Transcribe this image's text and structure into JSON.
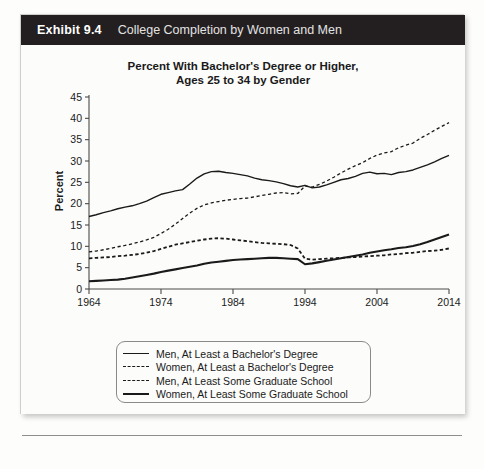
{
  "exhibit": {
    "number": "Exhibit 9.4",
    "caption": "College Completion by Women and Men"
  },
  "chart_data": {
    "type": "line",
    "title": "Percent With Bachelor's Degree or Higher, Ages 25 to 34 by Gender",
    "title_line1": "Percent With Bachelor's Degree or Higher,",
    "title_line2": "Ages 25 to 34 by Gender",
    "xlabel": "",
    "ylabel": "Percent",
    "xlim": [
      1964,
      2014
    ],
    "ylim": [
      0,
      45
    ],
    "ytick_step": 5,
    "xtick_step": 10,
    "grid": false,
    "legend_position": "below-plot",
    "yticks": [
      "0",
      "5",
      "10",
      "15",
      "20",
      "25",
      "30",
      "35",
      "40",
      "45"
    ],
    "xticks": [
      "1964",
      "1974",
      "1984",
      "1994",
      "2004",
      "2014"
    ],
    "x": [
      1964,
      1965,
      1966,
      1967,
      1968,
      1969,
      1970,
      1971,
      1972,
      1973,
      1974,
      1975,
      1976,
      1977,
      1978,
      1979,
      1980,
      1981,
      1982,
      1983,
      1984,
      1985,
      1986,
      1987,
      1988,
      1989,
      1990,
      1991,
      1992,
      1993,
      1994,
      1995,
      1996,
      1997,
      1998,
      1999,
      2000,
      2001,
      2002,
      2003,
      2004,
      2005,
      2006,
      2007,
      2008,
      2009,
      2010,
      2011,
      2012,
      2013,
      2014
    ],
    "series": [
      {
        "name": "Men, At Least a Bachelor's Degree",
        "style": "solid",
        "width": 1.4,
        "color": "#1a1a1a",
        "values": [
          17.0,
          17.4,
          17.9,
          18.3,
          18.8,
          19.2,
          19.5,
          20.0,
          20.6,
          21.4,
          22.2,
          22.6,
          23.0,
          23.3,
          24.6,
          26.0,
          27.0,
          27.5,
          27.6,
          27.3,
          27.1,
          26.8,
          26.5,
          26.0,
          25.6,
          25.4,
          25.1,
          24.7,
          24.2,
          23.9,
          24.3,
          23.7,
          23.9,
          24.4,
          25.0,
          25.6,
          25.9,
          26.4,
          27.1,
          27.4,
          27.0,
          27.1,
          26.8,
          27.3,
          27.5,
          27.9,
          28.5,
          29.1,
          29.8,
          30.6,
          31.3
        ]
      },
      {
        "name": "Women, At Least a Bachelor's Degree",
        "style": "dashed",
        "width": 1.3,
        "color": "#1a1a1a",
        "values": [
          8.7,
          8.9,
          9.2,
          9.5,
          9.9,
          10.2,
          10.6,
          11.0,
          11.5,
          12.1,
          13.0,
          14.0,
          15.2,
          16.5,
          17.8,
          18.9,
          19.7,
          20.2,
          20.5,
          20.8,
          21.0,
          21.2,
          21.3,
          21.6,
          21.9,
          22.2,
          22.5,
          22.6,
          22.3,
          22.4,
          24.1,
          23.9,
          24.5,
          25.3,
          26.2,
          27.2,
          28.1,
          28.9,
          29.6,
          30.6,
          31.4,
          31.9,
          32.2,
          33.1,
          33.7,
          34.2,
          35.3,
          36.2,
          37.2,
          38.1,
          39.0
        ]
      },
      {
        "name": "Men, At Least Some Graduate School",
        "style": "dashed",
        "width": 1.8,
        "color": "#1a1a1a",
        "values": [
          7.2,
          7.3,
          7.4,
          7.5,
          7.7,
          7.8,
          8.0,
          8.2,
          8.5,
          8.9,
          9.4,
          9.9,
          10.4,
          10.7,
          11.0,
          11.3,
          11.6,
          11.8,
          11.9,
          11.8,
          11.6,
          11.4,
          11.2,
          11.0,
          10.8,
          10.7,
          10.6,
          10.5,
          10.3,
          9.5,
          7.1,
          6.9,
          7.0,
          7.1,
          7.2,
          7.3,
          7.4,
          7.5,
          7.6,
          7.7,
          7.8,
          7.9,
          8.1,
          8.2,
          8.4,
          8.5,
          8.7,
          8.9,
          9.0,
          9.2,
          9.5
        ]
      },
      {
        "name": "Women, At Least Some Graduate School",
        "style": "solid",
        "width": 2.1,
        "color": "#1a1a1a",
        "values": [
          1.8,
          1.9,
          2.0,
          2.1,
          2.2,
          2.4,
          2.7,
          3.0,
          3.3,
          3.6,
          4.0,
          4.3,
          4.6,
          4.9,
          5.2,
          5.5,
          5.9,
          6.2,
          6.4,
          6.6,
          6.8,
          6.9,
          7.0,
          7.1,
          7.2,
          7.3,
          7.3,
          7.2,
          7.1,
          7.0,
          5.8,
          6.0,
          6.3,
          6.6,
          6.9,
          7.2,
          7.5,
          7.8,
          8.1,
          8.5,
          8.8,
          9.1,
          9.3,
          9.6,
          9.8,
          10.1,
          10.5,
          11.0,
          11.6,
          12.2,
          12.8
        ]
      }
    ]
  },
  "legend": {
    "items": [
      {
        "label": "Men, At Least a Bachelor's Degree",
        "style": "solid"
      },
      {
        "label": "Women, At Least a Bachelor's Degree",
        "style": "dashed"
      },
      {
        "label": "Men, At Least Some Graduate School",
        "style": "dashed"
      },
      {
        "label": "Women, At Least Some Graduate School",
        "style": "solid"
      }
    ]
  }
}
